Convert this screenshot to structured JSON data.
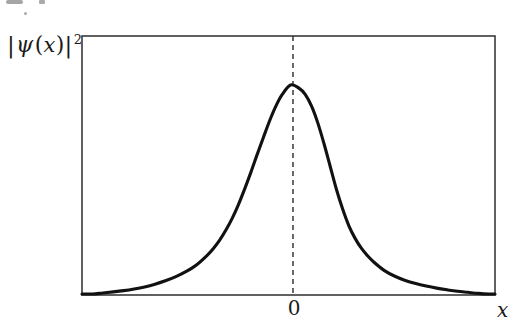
{
  "figure": {
    "kind": "line-plot",
    "background_color": "#ffffff",
    "ink_color": "#1a1a1a"
  },
  "labels": {
    "y_axis": {
      "full_text": "|ψ(x)|²",
      "left_bar": "|",
      "psi": "ψ",
      "open_paren": "(",
      "variable": "x",
      "close_paren": ")",
      "right_bar": "|",
      "exponent": "2"
    },
    "x_axis": "x",
    "origin_tick": "0"
  },
  "frame": {
    "left": 82,
    "top": 36,
    "right": 495,
    "bottom": 295,
    "stroke": "#3a3a3a",
    "stroke_width": 1.6
  },
  "center_line": {
    "x": 293,
    "y_top": 36,
    "y_bottom": 295,
    "style": "dashed",
    "dash": "5,4",
    "stroke": "#2b2b2b",
    "stroke_width": 1.4
  },
  "curve": {
    "stroke": "#111111",
    "stroke_width": 3.1,
    "peak_x": 293,
    "peak_y": 85,
    "baseline_y": 294,
    "left_merge_x": 120,
    "right_merge_x": 452
  },
  "chart_data": {
    "type": "line",
    "title": "",
    "xlabel": "x",
    "ylabel": "|ψ(x)|²",
    "grid": false,
    "legend": null,
    "axis_ticks": {
      "x": [
        "0"
      ],
      "y": []
    },
    "annotations": [
      {
        "type": "vline",
        "x": 0,
        "style": "dashed",
        "label": "0"
      }
    ],
    "axis_ranges": {
      "xlim": [
        -5.0,
        4.9
      ],
      "ylim": [
        0,
        1.12
      ]
    },
    "series": [
      {
        "name": "|psi(x)|^2",
        "x": [
          -5.0,
          -4.75,
          -4.5,
          -4.25,
          -4.0,
          -3.75,
          -3.5,
          -3.25,
          -3.0,
          -2.75,
          -2.5,
          -2.25,
          -2.0,
          -1.85,
          -1.7,
          -1.55,
          -1.4,
          -1.25,
          -1.1,
          -0.95,
          -0.8,
          -0.65,
          -0.5,
          -0.35,
          -0.2,
          0.0,
          0.2,
          0.35,
          0.5,
          0.65,
          0.8,
          0.95,
          1.1,
          1.25,
          1.4,
          1.55,
          1.7,
          1.85,
          2.0,
          2.25,
          2.5,
          2.75,
          3.0,
          3.25,
          3.5,
          3.75,
          4.0,
          4.25,
          4.5,
          4.75,
          4.9
        ],
        "y": [
          0.0,
          0.0,
          0.005,
          0.01,
          0.016,
          0.024,
          0.034,
          0.047,
          0.063,
          0.083,
          0.108,
          0.14,
          0.185,
          0.218,
          0.258,
          0.306,
          0.362,
          0.428,
          0.503,
          0.583,
          0.668,
          0.75,
          0.83,
          0.9,
          0.955,
          1.0,
          0.985,
          0.955,
          0.9,
          0.82,
          0.72,
          0.61,
          0.5,
          0.405,
          0.325,
          0.265,
          0.218,
          0.182,
          0.152,
          0.112,
          0.085,
          0.065,
          0.05,
          0.038,
          0.028,
          0.02,
          0.013,
          0.008,
          0.003,
          0.0,
          0.0
        ]
      }
    ]
  }
}
